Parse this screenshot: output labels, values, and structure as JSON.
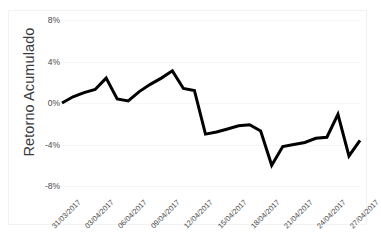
{
  "chart_data": {
    "type": "line",
    "title": "",
    "xlabel": "",
    "ylabel": "Retorno Acumulado",
    "ylim": [
      -8,
      8
    ],
    "y_ticks": [
      "8%",
      "4%",
      "0%",
      "-4%",
      "-8%"
    ],
    "y_tick_values": [
      8,
      4,
      0,
      -4,
      -8
    ],
    "grid": true,
    "legend": "none",
    "line_color": "#000000",
    "background_color": "#ffffff",
    "gridline_color": "#f6f6f6",
    "x_tick_labels": [
      "31/03/2017",
      "03/04/2017",
      "06/04/2017",
      "09/04/2017",
      "12/04/2017",
      "15/04/2017",
      "18/04/2017",
      "21/04/2017",
      "24/04/2017",
      "27/04/2017"
    ],
    "series": [
      {
        "name": "Retorno Acumulado",
        "values": [
          0.0,
          0.6,
          1.0,
          1.3,
          2.4,
          0.4,
          0.2,
          1.1,
          1.8,
          2.4,
          3.1,
          1.4,
          1.2,
          -3.0,
          -2.8,
          -2.5,
          -2.2,
          -2.1,
          -2.7,
          -6.0,
          -4.2,
          -4.0,
          -3.8,
          -3.4,
          -3.3,
          -1.1,
          -5.1,
          -3.6
        ]
      }
    ]
  }
}
